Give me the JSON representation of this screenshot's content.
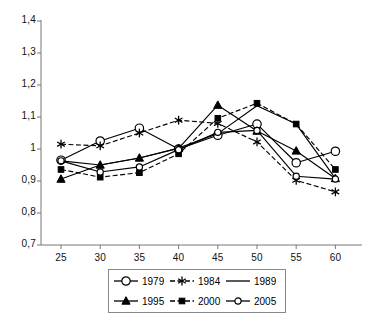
{
  "chart_data": {
    "type": "line",
    "title": "",
    "xlabel": "",
    "ylabel": "",
    "categories": [
      25,
      30,
      35,
      40,
      45,
      50,
      55,
      60
    ],
    "x_tick_labels": [
      "25",
      "30",
      "35",
      "40",
      "45",
      "50",
      "55",
      "60"
    ],
    "y_tick_labels": [
      "0,7",
      "0,8",
      "0,9",
      "1",
      "1,1",
      "1,2",
      "1,3",
      "1,4"
    ],
    "y_tick_values": [
      0.7,
      0.8,
      0.9,
      1.0,
      1.1,
      1.2,
      1.3,
      1.4
    ],
    "ylim": [
      0.7,
      1.4
    ],
    "grid": false,
    "legend_position": "bottom",
    "decimal_separator": ",",
    "series": [
      {
        "name": "1979",
        "marker": "open-circle",
        "dash": "solid",
        "color": "#000000",
        "values": [
          0.965,
          1.025,
          1.065,
          1.0,
          1.043,
          1.078,
          0.957,
          0.993
        ]
      },
      {
        "name": "1984",
        "marker": "asterisk",
        "dash": "dashed",
        "color": "#000000",
        "values": [
          1.015,
          1.01,
          1.05,
          1.09,
          1.08,
          1.022,
          0.902,
          0.866
        ]
      },
      {
        "name": "1989",
        "marker": "none",
        "dash": "solid",
        "color": "#000000",
        "values": [
          0.963,
          0.95,
          0.972,
          1.003,
          1.048,
          1.135,
          1.078,
          0.908
        ]
      },
      {
        "name": "1995",
        "marker": "filled-triangle",
        "dash": "solid",
        "color": "#000000",
        "values": [
          0.906,
          0.95,
          0.972,
          1.002,
          1.137,
          1.056,
          0.994,
          0.908
        ]
      },
      {
        "name": "2000",
        "marker": "filled-square",
        "dash": "dashed",
        "color": "#000000",
        "values": [
          0.936,
          0.912,
          0.926,
          0.985,
          1.096,
          1.143,
          1.078,
          0.936
        ]
      },
      {
        "name": "2005",
        "marker": "small-open-circle",
        "dash": "solid",
        "color": "#000000",
        "values": [
          0.963,
          0.928,
          0.944,
          0.998,
          1.052,
          1.058,
          0.915,
          0.906
        ]
      }
    ]
  },
  "legend": {
    "entries": [
      {
        "label": "1979"
      },
      {
        "label": "1984"
      },
      {
        "label": "1989"
      },
      {
        "label": "1995"
      },
      {
        "label": "2000"
      },
      {
        "label": "2005"
      }
    ]
  }
}
